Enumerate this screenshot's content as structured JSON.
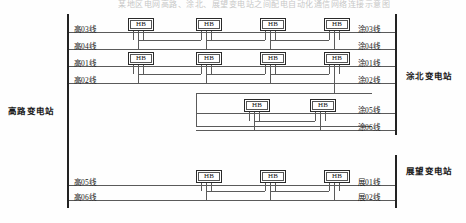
{
  "diagram": {
    "title": "某地区电网高路、涂北、展望变电站之间配电自动化通信网络连接示意图",
    "type": "single-line-network-diagram",
    "colors": {
      "line": "#5a5a5a",
      "bus": "#222222",
      "box_border": "#2a2a2a",
      "text": "#1a1a1a",
      "background": "#fefefe"
    },
    "substations": [
      {
        "id": "gaolu",
        "name": "高路变电站",
        "side": "left",
        "x": 10,
        "y": 108
      },
      {
        "id": "tubei",
        "name": "涂北变电站",
        "side": "right",
        "x": 408,
        "y": 73
      },
      {
        "id": "zhanwang",
        "name": "展望变电站",
        "side": "right",
        "x": 408,
        "y": 168
      }
    ],
    "buses": [
      {
        "name": "left-bus",
        "x": 68,
        "y1": 14,
        "y2": 208
      },
      {
        "name": "right-bus-upper",
        "x": 396,
        "y1": 14,
        "y2": 135
      },
      {
        "name": "right-bus-lower",
        "x": 396,
        "y1": 155,
        "y2": 208
      }
    ],
    "feeders": [
      {
        "id": "f1",
        "left_label": "高03线",
        "right_label": "涂03线",
        "y": 32,
        "hb_count": 4
      },
      {
        "id": "f2",
        "left_label": "高04线",
        "right_label": "涂04线",
        "y": 49,
        "hb_count": 4
      },
      {
        "id": "f3",
        "left_label": "高01线",
        "right_label": "涂01线",
        "y": 66,
        "hb_count": 4
      },
      {
        "id": "f4",
        "left_label": "高02线",
        "right_label": "涂02线",
        "y": 83,
        "hb_count": 0
      },
      {
        "id": "f5",
        "left_label": "",
        "right_label": "涂05线",
        "y": 113,
        "hb_count": 2
      },
      {
        "id": "f6",
        "left_label": "",
        "right_label": "涂06线",
        "y": 130,
        "hb_count": 0
      },
      {
        "id": "f7",
        "left_label": "高05线",
        "right_label": "展01线",
        "y": 185,
        "hb_count": 3
      },
      {
        "id": "f8",
        "left_label": "高06线",
        "right_label": "展02线",
        "y": 200,
        "hb_count": 0
      }
    ],
    "hb_device_label": "HB",
    "hb_nodes": [
      {
        "row": 1,
        "x": 128,
        "y": 18
      },
      {
        "row": 1,
        "x": 196,
        "y": 18
      },
      {
        "row": 1,
        "x": 260,
        "y": 18
      },
      {
        "row": 1,
        "x": 324,
        "y": 18
      },
      {
        "row": 2,
        "x": 128,
        "y": 52
      },
      {
        "row": 2,
        "x": 196,
        "y": 52
      },
      {
        "row": 2,
        "x": 260,
        "y": 52
      },
      {
        "row": 2,
        "x": 324,
        "y": 52
      },
      {
        "row": 3,
        "x": 244,
        "y": 99
      },
      {
        "row": 3,
        "x": 310,
        "y": 99
      },
      {
        "row": 4,
        "x": 196,
        "y": 170
      },
      {
        "row": 4,
        "x": 260,
        "y": 170
      },
      {
        "row": 4,
        "x": 324,
        "y": 170
      }
    ],
    "loop_box": {
      "x1": 196,
      "y1": 93,
      "x2": 372,
      "y2": 126
    }
  }
}
